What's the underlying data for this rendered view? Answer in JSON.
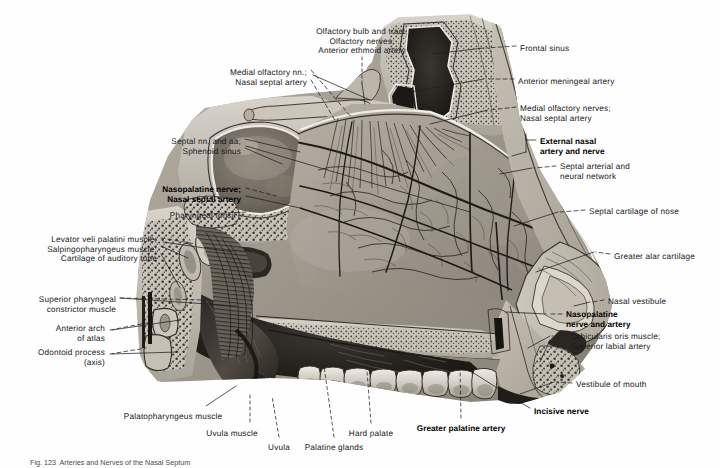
{
  "plate": {
    "title": "Nasal septum: arteries and nerves — median sagittal section",
    "caption": "Fig. 123  Arteries and Nerves of the Nasal Septum",
    "background_color": "#ffffff",
    "ink_color": "#16181a"
  },
  "labels": {
    "top": [
      {
        "id": "olfactory-bulb-and-tract",
        "lines": [
          "Olfactory bulb and tract;",
          "Olfactory nerves;",
          "Anterior ethmoid artery"
        ],
        "align": "c",
        "bold": false,
        "x": 362,
        "y": 27
      },
      {
        "id": "medial-olfactory-nn",
        "lines": [
          "Medial olfactory nn.;",
          "Nasal septal artery"
        ],
        "align": "r",
        "bold": false,
        "x": 307,
        "y": 68
      }
    ],
    "left": [
      {
        "id": "septal-nn-and-aa",
        "lines": [
          "Septal nn. and aa;",
          "Sphenoid sinus"
        ],
        "align": "r",
        "bold": false,
        "x": 241,
        "y": 137
      },
      {
        "id": "nasopalatine-nerve",
        "lines": [
          "Nasopalatine nerve;",
          "Nasal septal artery"
        ],
        "align": "r",
        "bold": true,
        "x": 241,
        "y": 185
      },
      {
        "id": "pharyngeal-tonsil",
        "lines": [
          "Pharyngeal tonsil -"
        ],
        "align": "r",
        "bold": false,
        "x": 241,
        "y": 211
      },
      {
        "id": "levator-veli-palatini",
        "lines": [
          "Levator veli palatini muscle;",
          "Salpingopharyngeus muscle;",
          "Cartilage of auditory tube"
        ],
        "align": "r",
        "bold": false,
        "x": 157,
        "y": 235
      },
      {
        "id": "superior-pharyngeal-constrictor",
        "lines": [
          "Superior pharyngeal",
          "constrictor muscle"
        ],
        "align": "r",
        "bold": false,
        "x": 116,
        "y": 295
      },
      {
        "id": "anterior-arch-of-atlas",
        "lines": [
          "Anterior arch",
          "of atlas"
        ],
        "align": "r",
        "bold": false,
        "x": 105,
        "y": 324
      },
      {
        "id": "odontoid-process",
        "lines": [
          "Odontoid process",
          "(axis)"
        ],
        "align": "r",
        "bold": false,
        "x": 105,
        "y": 348
      }
    ],
    "right": [
      {
        "id": "frontal-sinus",
        "lines": [
          "Frontal sinus"
        ],
        "align": "l",
        "bold": false,
        "x": 520,
        "y": 44
      },
      {
        "id": "anterior-meningeal-artery",
        "lines": [
          "Anterior meningeal artery"
        ],
        "align": "l",
        "bold": false,
        "x": 518,
        "y": 77
      },
      {
        "id": "medial-olfactory-nerves",
        "lines": [
          "Medial olfactory nerves;",
          "Nasal septal artery"
        ],
        "align": "l",
        "bold": false,
        "x": 520,
        "y": 104
      },
      {
        "id": "external-nasal-artery-and-nerve",
        "lines": [
          "External nasal",
          "artery and nerve"
        ],
        "align": "l",
        "bold": true,
        "x": 540,
        "y": 137
      },
      {
        "id": "septal-arterial-and-neural-network",
        "lines": [
          "Septal arterial and",
          "neural network"
        ],
        "align": "l",
        "bold": false,
        "x": 560,
        "y": 162
      },
      {
        "id": "septal-cartilage-of-nose",
        "lines": [
          "Septal cartilage of nose"
        ],
        "align": "l",
        "bold": false,
        "x": 589,
        "y": 207
      },
      {
        "id": "greater-alar-cartilage",
        "lines": [
          "Greater alar cartilage"
        ],
        "align": "l",
        "bold": false,
        "x": 614,
        "y": 252
      },
      {
        "id": "nasal-vestibule",
        "lines": [
          "Nasal vestibule"
        ],
        "align": "l",
        "bold": false,
        "x": 608,
        "y": 297
      },
      {
        "id": "nasopalatine-nerve-and-artery",
        "lines": [
          "Nasopalatine",
          "nerve and artery"
        ],
        "align": "l",
        "bold": true,
        "x": 566,
        "y": 310
      },
      {
        "id": "orbicularis-oris-muscle",
        "lines": [
          "Orbicularis oris muscle;",
          "Superior labial artery"
        ],
        "align": "l",
        "bold": false,
        "x": 571,
        "y": 332
      },
      {
        "id": "vestibule-of-mouth",
        "lines": [
          "Vestibule of mouth"
        ],
        "align": "l",
        "bold": false,
        "x": 576,
        "y": 380
      }
    ],
    "bottom": [
      {
        "id": "palatopharyngeus-muscle",
        "lines": [
          "Palatopharyngeus muscle"
        ],
        "align": "c",
        "bold": false,
        "x": 173,
        "y": 412
      },
      {
        "id": "uvula-muscle",
        "lines": [
          "Uvula muscle"
        ],
        "align": "c",
        "bold": false,
        "x": 232,
        "y": 429
      },
      {
        "id": "uvula",
        "lines": [
          "Uvula"
        ],
        "align": "c",
        "bold": false,
        "x": 279,
        "y": 443
      },
      {
        "id": "palatine-glands",
        "lines": [
          "Palatine glands"
        ],
        "align": "c",
        "bold": false,
        "x": 334,
        "y": 443
      },
      {
        "id": "hard-palate",
        "lines": [
          "Hard palate"
        ],
        "align": "c",
        "bold": false,
        "x": 371,
        "y": 429
      },
      {
        "id": "greater-palatine-artery",
        "lines": [
          "Greater palatine artery"
        ],
        "align": "c",
        "bold": true,
        "x": 461,
        "y": 424
      },
      {
        "id": "incisive-nerve",
        "lines": [
          "Incisive nerve"
        ],
        "align": "l",
        "bold": true,
        "x": 534,
        "y": 407
      }
    ]
  }
}
